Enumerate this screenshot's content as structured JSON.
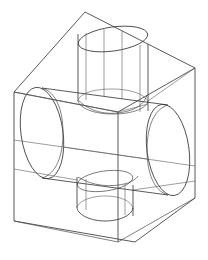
{
  "view": {
    "title": "3D Wireframe Model",
    "width": 208,
    "height": 260,
    "background_color": "#ffffff",
    "line_color": "#303030",
    "projection": "isometric",
    "render_mode": "wireframe",
    "units": "px"
  },
  "model": {
    "name": "cylinder-cross-block",
    "description": "Rectangular box enclosure with a large horizontal cylinder, an intersecting vertical cylinder through the top face, and a smaller cylinder protruding from the bottom face",
    "solid_count": 4
  },
  "geometry": {
    "box": {
      "name": "enclosing-box",
      "label": "Box",
      "vertices": {
        "top_back": [
          85,
          12
        ],
        "top_left": [
          14,
          92
        ],
        "top_right": [
          195,
          68
        ],
        "top_front": [
          118,
          112
        ],
        "bottom_left": [
          14,
          221
        ],
        "bottom_right": [
          195,
          198
        ],
        "bottom_front": [
          135,
          242
        ]
      },
      "edges": [
        [
          [
            14,
            92
          ],
          [
            85,
            12
          ]
        ],
        [
          [
            85,
            12
          ],
          [
            195,
            68
          ]
        ],
        [
          [
            14,
            92
          ],
          [
            118,
            112
          ]
        ],
        [
          [
            118,
            112
          ],
          [
            195,
            68
          ]
        ],
        [
          [
            14,
            92
          ],
          [
            14,
            221
          ]
        ],
        [
          [
            195,
            68
          ],
          [
            195,
            198
          ]
        ],
        [
          [
            118,
            112
          ],
          [
            135,
            242
          ]
        ],
        [
          [
            14,
            221
          ],
          [
            135,
            242
          ]
        ],
        [
          [
            135,
            242
          ],
          [
            195,
            198
          ]
        ]
      ]
    },
    "horizontal_cylinder": {
      "name": "main-horizontal-cylinder",
      "label": "Horizontal cylinder",
      "axis": "x",
      "left_cap": {
        "cx": 42,
        "cy": 133,
        "rx": 21,
        "ry": 46,
        "rotation": -10
      },
      "right_cap": {
        "cx": 168,
        "cy": 150,
        "rx": 21,
        "ry": 46,
        "rotation": -10
      },
      "silhouette_top": [
        [
          42,
          88
        ],
        [
          168,
          105
        ]
      ],
      "silhouette_bottom": [
        [
          42,
          178
        ],
        [
          168,
          195
        ]
      ]
    },
    "vertical_cylinder": {
      "name": "top-vertical-cylinder",
      "label": "Vertical cylinder (top)",
      "axis": "z",
      "top_cap": {
        "cx": 113,
        "cy": 39,
        "rx": 35,
        "ry": 12,
        "rotation": -9
      },
      "bottom_cap": {
        "cx": 113,
        "cy": 106,
        "rx": 35,
        "ry": 12,
        "rotation": -9
      },
      "silhouette_left": [
        [
          79,
          34
        ],
        [
          79,
          101
        ]
      ],
      "silhouette_right": [
        [
          147,
          44
        ],
        [
          147,
          111
        ]
      ]
    },
    "bottom_cylinder": {
      "name": "bottom-vertical-cylinder",
      "label": "Vertical cylinder (bottom)",
      "axis": "z",
      "top_cap": {
        "cx": 105,
        "cy": 181,
        "rx": 28,
        "ry": 10,
        "rotation": -9
      },
      "bottom_cap": {
        "cx": 105,
        "cy": 212,
        "rx": 28,
        "ry": 10,
        "rotation": -9
      },
      "silhouette_left": [
        [
          78,
          177
        ],
        [
          78,
          208
        ]
      ],
      "silhouette_right": [
        [
          132,
          185
        ],
        [
          132,
          216
        ]
      ]
    }
  }
}
